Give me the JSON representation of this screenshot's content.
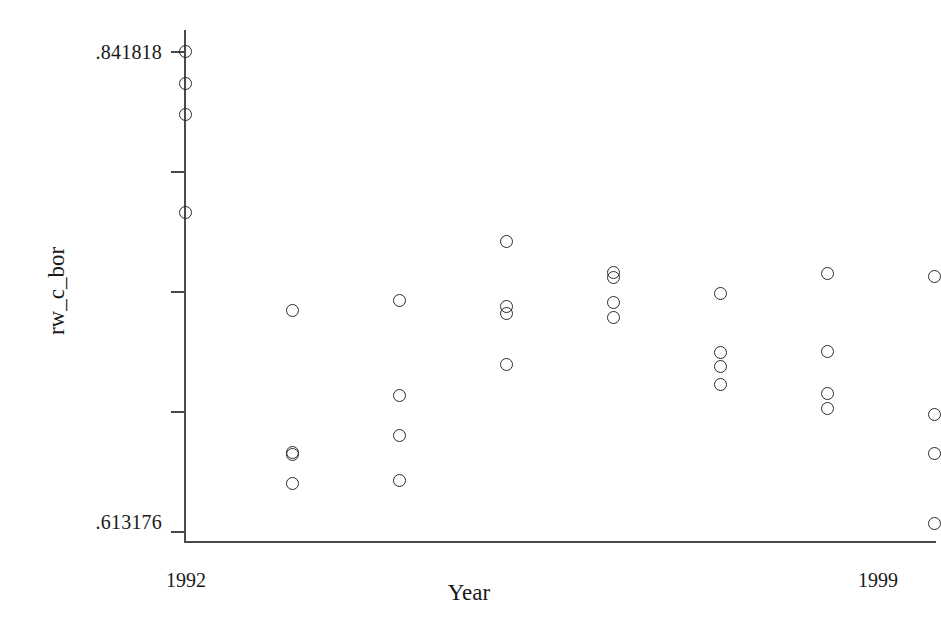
{
  "chart_data": {
    "type": "scatter",
    "title": "",
    "xlabel": "Year",
    "ylabel": "rw_c_bor",
    "xlim": [
      1992,
      1999
    ],
    "ylim": [
      0.613176,
      0.841818
    ],
    "grid": false,
    "legend": null,
    "marker": "open-circle",
    "y_tick_labels": [
      ".841818",
      ".613176"
    ],
    "y_tick_values": [
      0.841818,
      0.613176
    ],
    "x_tick_labels": [
      "1992",
      "1999"
    ],
    "x_tick_values": [
      1992,
      1999
    ],
    "y_tick_count": 5,
    "x_tick_count": 8,
    "series": [
      {
        "name": "rw_c_bor",
        "points": [
          {
            "x": 1992,
            "y": 0.8418
          },
          {
            "x": 1992,
            "y": 0.8261
          },
          {
            "x": 1992,
            "y": 0.8118
          },
          {
            "x": 1992,
            "y": 0.7651
          },
          {
            "x": 1993,
            "y": 0.718
          },
          {
            "x": 1993,
            "y": 0.6508
          },
          {
            "x": 1993,
            "y": 0.6498
          },
          {
            "x": 1993,
            "y": 0.636
          },
          {
            "x": 1994,
            "y": 0.7232
          },
          {
            "x": 1994,
            "y": 0.6779
          },
          {
            "x": 1994,
            "y": 0.6589
          },
          {
            "x": 1994,
            "y": 0.637
          },
          {
            "x": 1995,
            "y": 0.7513
          },
          {
            "x": 1995,
            "y": 0.7199
          },
          {
            "x": 1995,
            "y": 0.7166
          },
          {
            "x": 1995,
            "y": 0.6927
          },
          {
            "x": 1996,
            "y": 0.7365
          },
          {
            "x": 1996,
            "y": 0.7337
          },
          {
            "x": 1996,
            "y": 0.7218
          },
          {
            "x": 1996,
            "y": 0.7151
          },
          {
            "x": 1997,
            "y": 0.7265
          },
          {
            "x": 1997,
            "y": 0.6984
          },
          {
            "x": 1997,
            "y": 0.6917
          },
          {
            "x": 1997,
            "y": 0.6831
          },
          {
            "x": 1998,
            "y": 0.7356
          },
          {
            "x": 1998,
            "y": 0.6989
          },
          {
            "x": 1998,
            "y": 0.6789
          },
          {
            "x": 1998,
            "y": 0.6713
          },
          {
            "x": 1999,
            "y": 0.7342
          },
          {
            "x": 1999,
            "y": 0.6689
          },
          {
            "x": 1999,
            "y": 0.6499
          },
          {
            "x": 1999,
            "y": 0.6166
          }
        ]
      }
    ]
  },
  "axes": {
    "y_label_top": ".841818",
    "y_label_bottom": ".613176",
    "x_label_first": "1992",
    "x_label_last": "1999",
    "x_title": "Year",
    "y_title": "rw_c_bor"
  },
  "colors": {
    "background": "#ffffff",
    "axis": "#4a4a4a",
    "marker": "#2b2b2b",
    "text": "#1a1a1a"
  }
}
